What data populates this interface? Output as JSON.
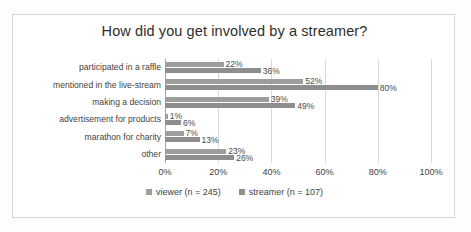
{
  "chart_data": {
    "type": "bar",
    "orientation": "horizontal",
    "title": "How did you get involved by a streamer?",
    "xlabel": "",
    "ylabel": "",
    "xlim": [
      0,
      100
    ],
    "xticks": [
      "0%",
      "20%",
      "40%",
      "60%",
      "80%",
      "100%"
    ],
    "xtick_values": [
      0,
      20,
      40,
      60,
      80,
      100
    ],
    "grid": true,
    "legend_position": "bottom",
    "categories": [
      "participated in a raffle",
      "mentioned in the live-stream",
      "making a decision",
      "advertisement for products",
      "marathon for charity",
      "other"
    ],
    "series": [
      {
        "name": "viewer (n = 245)",
        "color": "#9d9d9d",
        "values": [
          22,
          52,
          39,
          1,
          7,
          23
        ],
        "labels": [
          "22%",
          "52%",
          "39%",
          "1%",
          "7%",
          "23%"
        ]
      },
      {
        "name": "streamer (n = 107)",
        "color": "#8e8e8e",
        "values": [
          36,
          80,
          49,
          6,
          13,
          26
        ],
        "labels": [
          "36%",
          "80%",
          "49%",
          "6%",
          "13%",
          "26%"
        ]
      }
    ]
  },
  "legend": {
    "items": [
      {
        "label": "viewer (n = 245)",
        "color": "#9d9d9d"
      },
      {
        "label": "streamer (n = 107)",
        "color": "#8e8e8e"
      }
    ]
  }
}
